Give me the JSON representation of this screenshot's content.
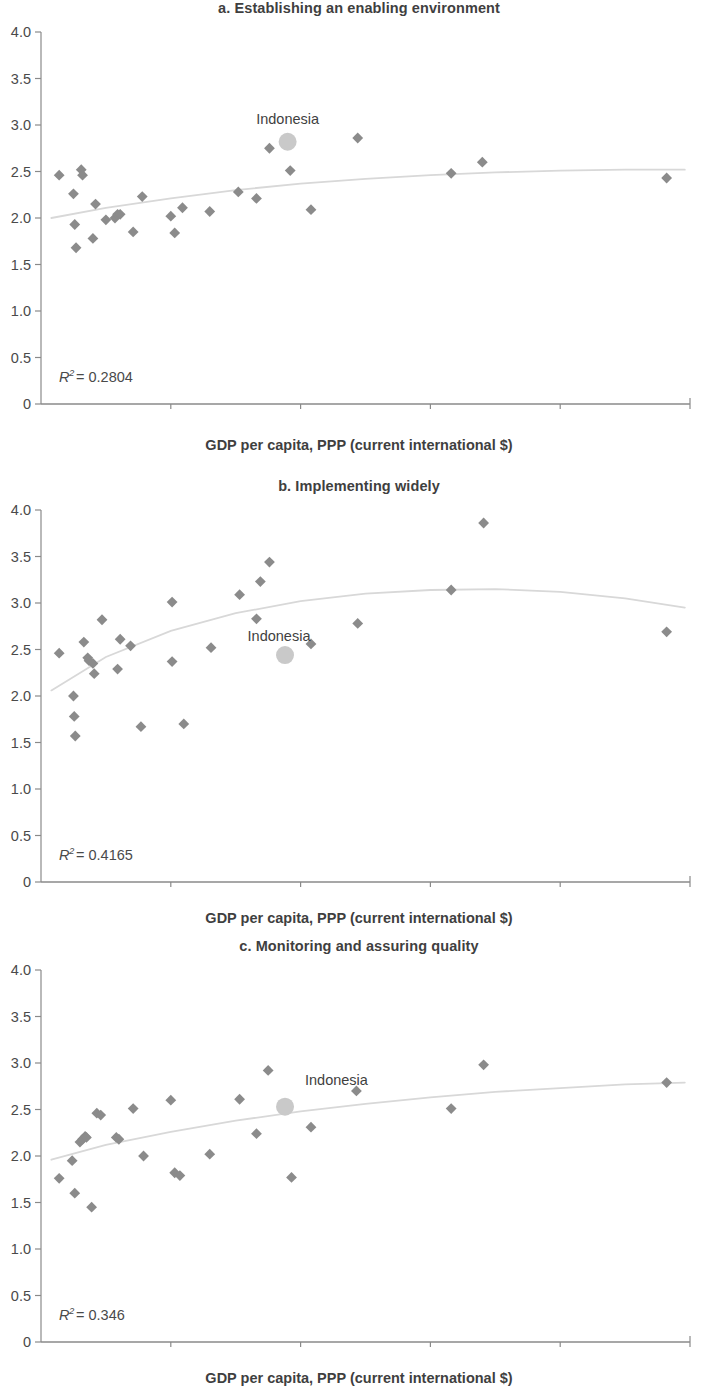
{
  "figure": {
    "axis_title": "GDP per capita, PPP (current international $)",
    "marker_color": "#8b8b8b",
    "highlight_color": "#c9c9c9",
    "trend_color": "#d8d8d8",
    "axis_color": "#8a8a8a",
    "y_ticks": [
      "0",
      "0.5",
      "1.0",
      "1.5",
      "2.0",
      "2.5",
      "3.0",
      "3.5",
      "4.0"
    ],
    "x_ticks": [
      "0",
      "5,000",
      "10,000",
      "15,000",
      "20,000",
      "25,000"
    ]
  },
  "panels": [
    {
      "id": "a",
      "title": "a. Establishing an enabling environment",
      "r2_label": "R",
      "r2_exp": "2",
      "r2_eq": " = ",
      "r2_value": "0.2804",
      "highlight_label": "Indonesia"
    },
    {
      "id": "b",
      "title": "b. Implementing widely",
      "r2_label": "R",
      "r2_exp": "2",
      "r2_eq": " = ",
      "r2_value": "0.4165",
      "highlight_label": "Indonesia"
    },
    {
      "id": "c",
      "title": "c. Monitoring and assuring quality",
      "r2_label": "R",
      "r2_exp": "2",
      "r2_eq": " = ",
      "r2_value": "0.346",
      "highlight_label": "Indonesia"
    }
  ],
  "chart_data": [
    {
      "type": "scatter",
      "panel": "a",
      "title": "a. Establishing an enabling environment",
      "xlabel": "GDP per capita, PPP (current international $)",
      "ylabel": "",
      "xlim": [
        0,
        25000
      ],
      "ylim": [
        0,
        4.0
      ],
      "xticks": [
        0,
        5000,
        10000,
        15000,
        20000,
        25000
      ],
      "yticks": [
        0,
        0.5,
        1.0,
        1.5,
        2.0,
        2.5,
        3.0,
        3.5,
        4.0
      ],
      "grid": false,
      "legend": "none",
      "r2": 0.2804,
      "points": [
        {
          "x": 700,
          "y": 2.46
        },
        {
          "x": 1250,
          "y": 2.26
        },
        {
          "x": 1300,
          "y": 1.93
        },
        {
          "x": 1350,
          "y": 1.68
        },
        {
          "x": 1550,
          "y": 2.52
        },
        {
          "x": 1600,
          "y": 2.46
        },
        {
          "x": 2000,
          "y": 1.78
        },
        {
          "x": 2100,
          "y": 2.15
        },
        {
          "x": 2500,
          "y": 1.98
        },
        {
          "x": 2850,
          "y": 2.0
        },
        {
          "x": 2950,
          "y": 2.04
        },
        {
          "x": 3050,
          "y": 2.04
        },
        {
          "x": 3550,
          "y": 1.85
        },
        {
          "x": 3900,
          "y": 2.23
        },
        {
          "x": 5000,
          "y": 2.02
        },
        {
          "x": 5150,
          "y": 1.84
        },
        {
          "x": 5450,
          "y": 2.11
        },
        {
          "x": 6500,
          "y": 2.07
        },
        {
          "x": 7600,
          "y": 2.28
        },
        {
          "x": 8300,
          "y": 2.21
        },
        {
          "x": 8800,
          "y": 2.75
        },
        {
          "x": 9600,
          "y": 2.51
        },
        {
          "x": 10400,
          "y": 2.09
        },
        {
          "x": 12200,
          "y": 2.86
        },
        {
          "x": 15800,
          "y": 2.48
        },
        {
          "x": 17000,
          "y": 2.6
        },
        {
          "x": 24100,
          "y": 2.43
        }
      ],
      "highlight": {
        "label": "Indonesia",
        "x": 9500,
        "y": 2.82
      },
      "trend": [
        {
          "x": 400,
          "y": 2.0
        },
        {
          "x": 2500,
          "y": 2.11
        },
        {
          "x": 5000,
          "y": 2.21
        },
        {
          "x": 7500,
          "y": 2.3
        },
        {
          "x": 10000,
          "y": 2.37
        },
        {
          "x": 12500,
          "y": 2.42
        },
        {
          "x": 15000,
          "y": 2.46
        },
        {
          "x": 17500,
          "y": 2.49
        },
        {
          "x": 20000,
          "y": 2.51
        },
        {
          "x": 22500,
          "y": 2.52
        },
        {
          "x": 24800,
          "y": 2.52
        }
      ]
    },
    {
      "type": "scatter",
      "panel": "b",
      "title": "b. Implementing widely",
      "xlabel": "GDP per capita, PPP (current international $)",
      "ylabel": "",
      "xlim": [
        0,
        25000
      ],
      "ylim": [
        0,
        4.0
      ],
      "xticks": [
        0,
        5000,
        10000,
        15000,
        20000,
        25000
      ],
      "yticks": [
        0,
        0.5,
        1.0,
        1.5,
        2.0,
        2.5,
        3.0,
        3.5,
        4.0
      ],
      "grid": false,
      "legend": "none",
      "r2": 0.4165,
      "points": [
        {
          "x": 700,
          "y": 2.46
        },
        {
          "x": 1250,
          "y": 2.0
        },
        {
          "x": 1280,
          "y": 1.78
        },
        {
          "x": 1320,
          "y": 1.57
        },
        {
          "x": 1650,
          "y": 2.58
        },
        {
          "x": 1800,
          "y": 2.41
        },
        {
          "x": 1850,
          "y": 2.38
        },
        {
          "x": 2000,
          "y": 2.35
        },
        {
          "x": 2050,
          "y": 2.24
        },
        {
          "x": 2350,
          "y": 2.82
        },
        {
          "x": 2950,
          "y": 2.29
        },
        {
          "x": 3050,
          "y": 2.61
        },
        {
          "x": 3450,
          "y": 2.54
        },
        {
          "x": 3850,
          "y": 1.67
        },
        {
          "x": 5050,
          "y": 3.01
        },
        {
          "x": 5050,
          "y": 2.37
        },
        {
          "x": 5500,
          "y": 1.7
        },
        {
          "x": 6550,
          "y": 2.52
        },
        {
          "x": 7650,
          "y": 3.09
        },
        {
          "x": 8300,
          "y": 2.83
        },
        {
          "x": 8450,
          "y": 3.23
        },
        {
          "x": 8800,
          "y": 3.44
        },
        {
          "x": 10400,
          "y": 2.56
        },
        {
          "x": 12200,
          "y": 2.78
        },
        {
          "x": 15800,
          "y": 3.14
        },
        {
          "x": 17050,
          "y": 3.86
        },
        {
          "x": 24100,
          "y": 2.69
        }
      ],
      "highlight": {
        "label": "Indonesia",
        "x": 9400,
        "y": 2.44
      },
      "trend": [
        {
          "x": 400,
          "y": 2.06
        },
        {
          "x": 2500,
          "y": 2.42
        },
        {
          "x": 5000,
          "y": 2.7
        },
        {
          "x": 7500,
          "y": 2.89
        },
        {
          "x": 10000,
          "y": 3.02
        },
        {
          "x": 12500,
          "y": 3.1
        },
        {
          "x": 15000,
          "y": 3.14
        },
        {
          "x": 17500,
          "y": 3.15
        },
        {
          "x": 20000,
          "y": 3.12
        },
        {
          "x": 22500,
          "y": 3.05
        },
        {
          "x": 24800,
          "y": 2.95
        }
      ]
    },
    {
      "type": "scatter",
      "panel": "c",
      "title": "c. Monitoring and assuring quality",
      "xlabel": "GDP per capita, PPP (current international $)",
      "ylabel": "",
      "xlim": [
        0,
        25000
      ],
      "ylim": [
        0,
        4.0
      ],
      "xticks": [
        0,
        5000,
        10000,
        15000,
        20000,
        25000
      ],
      "yticks": [
        0,
        0.5,
        1.0,
        1.5,
        2.0,
        2.5,
        3.0,
        3.5,
        4.0
      ],
      "grid": false,
      "legend": "none",
      "r2": 0.346,
      "points": [
        {
          "x": 700,
          "y": 1.76
        },
        {
          "x": 1200,
          "y": 1.95
        },
        {
          "x": 1300,
          "y": 1.6
        },
        {
          "x": 1500,
          "y": 2.15
        },
        {
          "x": 1600,
          "y": 2.18
        },
        {
          "x": 1700,
          "y": 2.21
        },
        {
          "x": 1750,
          "y": 2.2
        },
        {
          "x": 1950,
          "y": 1.45
        },
        {
          "x": 2150,
          "y": 2.46
        },
        {
          "x": 2300,
          "y": 2.44
        },
        {
          "x": 2900,
          "y": 2.2
        },
        {
          "x": 3000,
          "y": 2.18
        },
        {
          "x": 3550,
          "y": 2.51
        },
        {
          "x": 3950,
          "y": 2.0
        },
        {
          "x": 5000,
          "y": 2.6
        },
        {
          "x": 5150,
          "y": 1.82
        },
        {
          "x": 5350,
          "y": 1.79
        },
        {
          "x": 6500,
          "y": 2.02
        },
        {
          "x": 7650,
          "y": 2.61
        },
        {
          "x": 8300,
          "y": 2.24
        },
        {
          "x": 8750,
          "y": 2.92
        },
        {
          "x": 9650,
          "y": 1.77
        },
        {
          "x": 10400,
          "y": 2.31
        },
        {
          "x": 12150,
          "y": 2.7
        },
        {
          "x": 15800,
          "y": 2.51
        },
        {
          "x": 17050,
          "y": 2.98
        },
        {
          "x": 24100,
          "y": 2.79
        }
      ],
      "highlight": {
        "label": "Indonesia",
        "x": 9400,
        "y": 2.53
      },
      "trend": [
        {
          "x": 400,
          "y": 1.96
        },
        {
          "x": 2500,
          "y": 2.12
        },
        {
          "x": 5000,
          "y": 2.26
        },
        {
          "x": 7500,
          "y": 2.38
        },
        {
          "x": 10000,
          "y": 2.48
        },
        {
          "x": 12500,
          "y": 2.56
        },
        {
          "x": 15000,
          "y": 2.63
        },
        {
          "x": 17500,
          "y": 2.69
        },
        {
          "x": 20000,
          "y": 2.73
        },
        {
          "x": 22500,
          "y": 2.77
        },
        {
          "x": 24800,
          "y": 2.79
        }
      ]
    }
  ]
}
